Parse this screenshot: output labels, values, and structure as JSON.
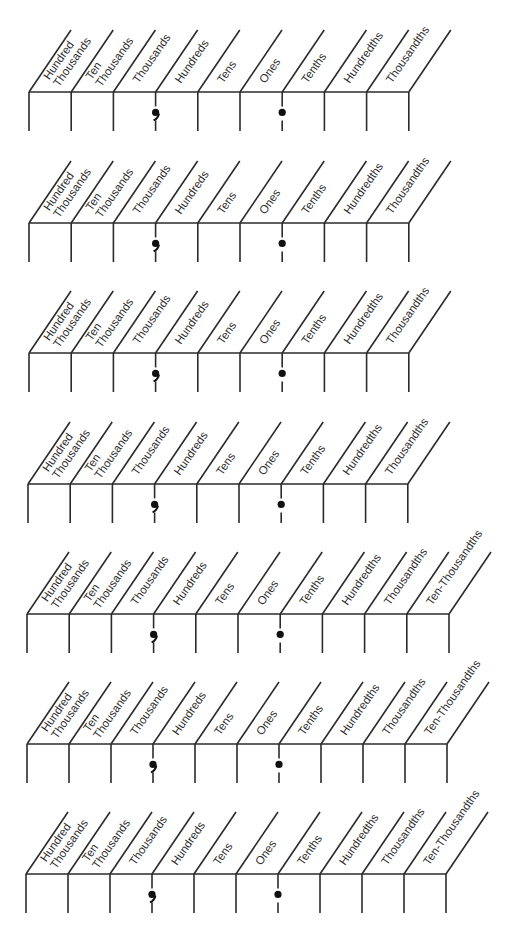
{
  "worksheet": {
    "line_color": "#2b2b2b",
    "charts": [
      {
        "top_y": 92,
        "bottom_y": 131,
        "left_x": 29,
        "col_width": 42.2,
        "columns": [
          {
            "lines": [
              "Hundred",
              "Thousands"
            ]
          },
          {
            "lines": [
              "Ten",
              "Thousands"
            ]
          },
          {
            "lines": [
              "Thousands"
            ]
          },
          {
            "lines": [
              "Hundreds"
            ]
          },
          {
            "lines": [
              "Tens"
            ]
          },
          {
            "lines": [
              "Ones"
            ]
          },
          {
            "lines": [
              "Tenths"
            ]
          },
          {
            "lines": [
              "Hundredths"
            ]
          },
          {
            "lines": [
              "Thousandths"
            ]
          }
        ],
        "comma_after_column": 2,
        "decimal_after_column": 5
      },
      {
        "top_y": 223,
        "bottom_y": 262,
        "left_x": 29,
        "col_width": 42.2,
        "columns": [
          {
            "lines": [
              "Hundred",
              "Thousands"
            ]
          },
          {
            "lines": [
              "Ten",
              "Thousands"
            ]
          },
          {
            "lines": [
              "Thousands"
            ]
          },
          {
            "lines": [
              "Hundreds"
            ]
          },
          {
            "lines": [
              "Tens"
            ]
          },
          {
            "lines": [
              "Ones"
            ]
          },
          {
            "lines": [
              "Tenths"
            ]
          },
          {
            "lines": [
              "Hundredths"
            ]
          },
          {
            "lines": [
              "Thousandths"
            ]
          }
        ],
        "comma_after_column": 2,
        "decimal_after_column": 5
      },
      {
        "top_y": 353,
        "bottom_y": 392,
        "left_x": 29,
        "col_width": 42.2,
        "columns": [
          {
            "lines": [
              "Hundred",
              "Thousands"
            ]
          },
          {
            "lines": [
              "Ten",
              "Thousands"
            ]
          },
          {
            "lines": [
              "Thousands"
            ]
          },
          {
            "lines": [
              "Hundreds"
            ]
          },
          {
            "lines": [
              "Tens"
            ]
          },
          {
            "lines": [
              "Ones"
            ]
          },
          {
            "lines": [
              "Tenths"
            ]
          },
          {
            "lines": [
              "Hundredths"
            ]
          },
          {
            "lines": [
              "Thousandths"
            ]
          }
        ],
        "comma_after_column": 2,
        "decimal_after_column": 5
      },
      {
        "top_y": 484,
        "bottom_y": 523,
        "left_x": 28,
        "col_width": 42.2,
        "columns": [
          {
            "lines": [
              "Hundred",
              "Thousands"
            ]
          },
          {
            "lines": [
              "Ten",
              "Thousands"
            ]
          },
          {
            "lines": [
              "Thousands"
            ]
          },
          {
            "lines": [
              "Hundreds"
            ]
          },
          {
            "lines": [
              "Tens"
            ]
          },
          {
            "lines": [
              "Ones"
            ]
          },
          {
            "lines": [
              "Tenths"
            ]
          },
          {
            "lines": [
              "Hundredths"
            ]
          },
          {
            "lines": [
              "Thousandths"
            ]
          }
        ],
        "comma_after_column": 2,
        "decimal_after_column": 5
      },
      {
        "top_y": 614,
        "bottom_y": 653,
        "left_x": 27,
        "col_width": 42.2,
        "columns": [
          {
            "lines": [
              "Hundred",
              "Thousands"
            ]
          },
          {
            "lines": [
              "Ten",
              "Thousands"
            ]
          },
          {
            "lines": [
              "Thousands"
            ]
          },
          {
            "lines": [
              "Hundreds"
            ]
          },
          {
            "lines": [
              "Tens"
            ]
          },
          {
            "lines": [
              "Ones"
            ]
          },
          {
            "lines": [
              "Tenths"
            ]
          },
          {
            "lines": [
              "Hundredths"
            ]
          },
          {
            "lines": [
              "Thousandths"
            ]
          },
          {
            "lines": [
              "Ten-Thousandths"
            ]
          }
        ],
        "comma_after_column": 2,
        "decimal_after_column": 5
      },
      {
        "top_y": 744,
        "bottom_y": 783,
        "left_x": 27,
        "col_width": 42.0,
        "columns": [
          {
            "lines": [
              "Hundred",
              "Thousands"
            ]
          },
          {
            "lines": [
              "Ten",
              "Thousands"
            ]
          },
          {
            "lines": [
              "Thousands"
            ]
          },
          {
            "lines": [
              "Hundreds"
            ]
          },
          {
            "lines": [
              "Tens"
            ]
          },
          {
            "lines": [
              "Ones"
            ]
          },
          {
            "lines": [
              "Tenths"
            ]
          },
          {
            "lines": [
              "Hundredths"
            ]
          },
          {
            "lines": [
              "Thousandths"
            ]
          },
          {
            "lines": [
              "Ten-Thousandths"
            ]
          }
        ],
        "comma_after_column": 2,
        "decimal_after_column": 5
      },
      {
        "top_y": 874,
        "bottom_y": 913,
        "left_x": 26,
        "col_width": 42.0,
        "columns": [
          {
            "lines": [
              "Hundred",
              "Thousands"
            ]
          },
          {
            "lines": [
              "Ten",
              "Thousands"
            ]
          },
          {
            "lines": [
              "Thousands"
            ]
          },
          {
            "lines": [
              "Hundreds"
            ]
          },
          {
            "lines": [
              "Tens"
            ]
          },
          {
            "lines": [
              "Ones"
            ]
          },
          {
            "lines": [
              "Tenths"
            ]
          },
          {
            "lines": [
              "Hundredths"
            ]
          },
          {
            "lines": [
              "Thousandths"
            ]
          },
          {
            "lines": [
              "Ten-Thousandths"
            ]
          }
        ],
        "comma_after_column": 2,
        "decimal_after_column": 5
      }
    ]
  }
}
